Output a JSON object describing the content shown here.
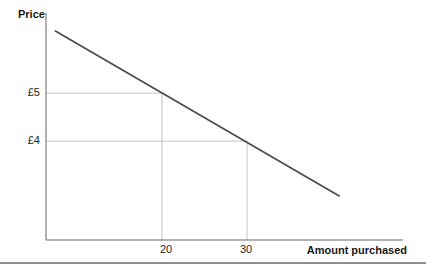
{
  "figure": {
    "background": "#ffffff",
    "kind": "textbook demand-curve diagram"
  },
  "chart_data": {
    "type": "line",
    "title": "",
    "xlabel": "Amount purchased",
    "ylabel": "Price",
    "x_tick_labels": [
      "20",
      "30"
    ],
    "y_tick_labels": [
      "£5",
      "£4"
    ],
    "points": [
      {
        "amount": 20,
        "price": 5,
        "x_label": "20",
        "y_label": "£5"
      },
      {
        "amount": 30,
        "price": 4,
        "x_label": "30",
        "y_label": "£4"
      }
    ],
    "series": [
      {
        "name": "demand curve",
        "shape": "straight downward-sloping line",
        "x": [
          7.4,
          40.9
        ],
        "y": [
          6.3,
          2.85
        ]
      }
    ],
    "xlim": [
      6.35,
      48.35
    ],
    "ylim": [
      1.94,
      6.67
    ],
    "grid": false,
    "legend": false,
    "colors": {
      "axis": "#999999",
      "reference_line": "#c4c4c4",
      "demand_line": "#4d4d4d",
      "text": "#262626",
      "bottom_rule": "#8f8f8f"
    }
  }
}
